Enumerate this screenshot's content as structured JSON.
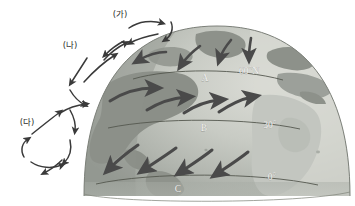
{
  "figure": {
    "background_color": "#ffffff",
    "width": 355,
    "height": 206
  },
  "globe": {
    "ocean_color": "#b9bdb8",
    "ocean_light_color": "#d7d8d2",
    "land_color": "#8f938c",
    "land_light_color": "#a8aba3",
    "edge_color": "#7c8079",
    "shadow_color": "#9ba09a"
  },
  "latitude_lines": [
    {
      "id": "lat-60n",
      "label": "60°N",
      "marker": "A"
    },
    {
      "id": "lat-30n",
      "label": "30°",
      "marker": "B"
    },
    {
      "id": "lat-0",
      "label": "0°",
      "marker": "C"
    }
  ],
  "globe_markers": [
    {
      "name": "marker-a",
      "text": "A"
    },
    {
      "name": "marker-b",
      "text": "B"
    },
    {
      "name": "marker-c",
      "text": "C"
    }
  ],
  "lat_texts": {
    "sixty_north": "60°N",
    "thirty": "30°",
    "zero": "0°"
  },
  "circulation_cells": [
    {
      "id": "cell-ga",
      "label": "(가)"
    },
    {
      "id": "cell-na",
      "label": "(나)"
    },
    {
      "id": "cell-da",
      "label": "(다)"
    }
  ],
  "cell_labels": {
    "ga": "(가)",
    "na": "(나)",
    "da": "(다)"
  },
  "wind_bands": [
    {
      "id": "polar-easterlies",
      "arrow_count": 4,
      "direction": "westward"
    },
    {
      "id": "westerlies",
      "arrow_count": 4,
      "direction": "eastward"
    },
    {
      "id": "trade-winds",
      "arrow_count": 4,
      "direction": "westward"
    }
  ],
  "arrow_color": "#4a4a4a",
  "cell_arrow_color": "#3a3a3a"
}
